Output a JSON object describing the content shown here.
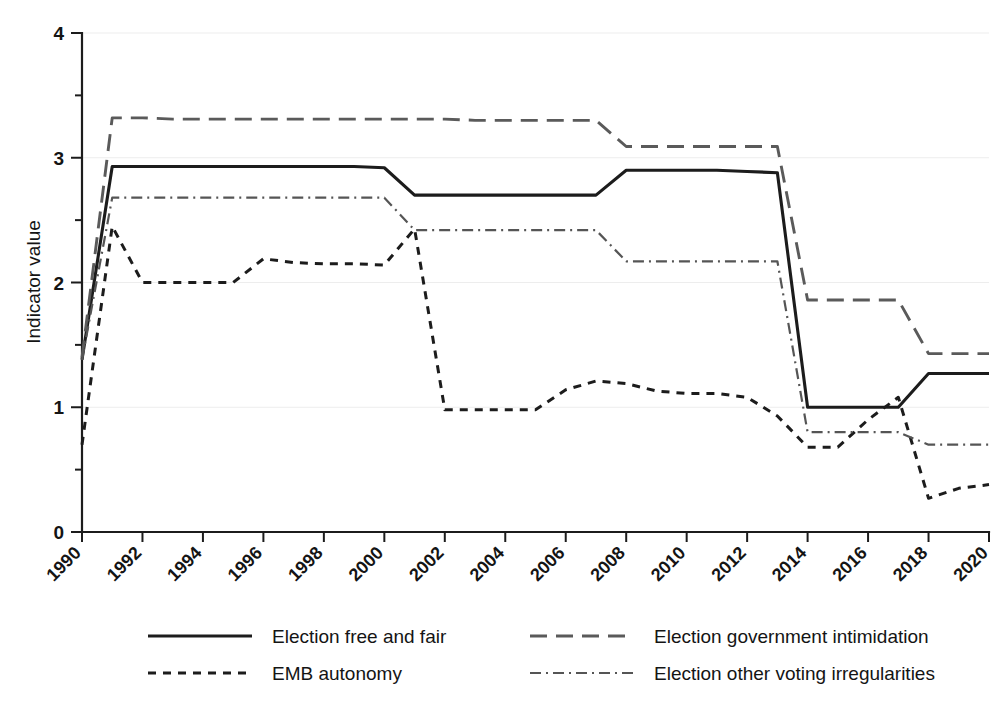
{
  "chart_data": {
    "type": "line",
    "title": "",
    "subtitle": "",
    "xlabel": "",
    "ylabel": "Indicator value",
    "xlim": [
      1990,
      2020
    ],
    "ylim": [
      0,
      4
    ],
    "grid": true,
    "legend_position": "bottom",
    "x_ticks": [
      "1990",
      "1992",
      "1994",
      "1996",
      "1998",
      "2000",
      "2002",
      "2004",
      "2006",
      "2008",
      "2010",
      "2012",
      "2014",
      "2016",
      "2018",
      "2020"
    ],
    "y_ticks": [
      "0",
      "1",
      "2",
      "3",
      "4"
    ],
    "x": [
      1990,
      1991,
      1992,
      1993,
      1994,
      1995,
      1996,
      1997,
      1998,
      1999,
      2000,
      2001,
      2002,
      2003,
      2004,
      2005,
      2006,
      2007,
      2008,
      2009,
      2010,
      2011,
      2012,
      2013,
      2014,
      2015,
      2016,
      2017,
      2018,
      2019,
      2020
    ],
    "series": [
      {
        "name": "Election free and fair",
        "style": "solid",
        "color": "#1c1c1c",
        "values": [
          1.38,
          2.93,
          2.93,
          2.93,
          2.93,
          2.93,
          2.93,
          2.93,
          2.93,
          2.93,
          2.92,
          2.7,
          2.7,
          2.7,
          2.7,
          2.7,
          2.7,
          2.7,
          2.9,
          2.9,
          2.9,
          2.9,
          2.89,
          2.88,
          1.0,
          1.0,
          1.0,
          1.0,
          1.27,
          1.27,
          1.27
        ]
      },
      {
        "name": "Election government intimidation",
        "style": "long-dash",
        "color": "#5a5a5a",
        "values": [
          1.4,
          3.32,
          3.32,
          3.31,
          3.31,
          3.31,
          3.31,
          3.31,
          3.31,
          3.31,
          3.31,
          3.31,
          3.31,
          3.3,
          3.3,
          3.3,
          3.3,
          3.3,
          3.09,
          3.09,
          3.09,
          3.09,
          3.09,
          3.09,
          1.86,
          1.86,
          1.86,
          1.86,
          1.43,
          1.43,
          1.43
        ]
      },
      {
        "name": "EMB autonomy",
        "style": "short-dash",
        "color": "#1c1c1c",
        "values": [
          0.7,
          2.45,
          2.0,
          2.0,
          2.0,
          2.0,
          2.19,
          2.16,
          2.15,
          2.15,
          2.14,
          2.43,
          0.98,
          0.98,
          0.98,
          0.98,
          1.14,
          1.21,
          1.19,
          1.13,
          1.11,
          1.11,
          1.08,
          0.93,
          0.68,
          0.68,
          0.9,
          1.08,
          0.27,
          0.35,
          0.38
        ]
      },
      {
        "name": "Election other voting irregularities",
        "style": "dash-dot",
        "color": "#555555",
        "values": [
          1.38,
          2.68,
          2.68,
          2.68,
          2.68,
          2.68,
          2.68,
          2.68,
          2.68,
          2.68,
          2.68,
          2.42,
          2.42,
          2.42,
          2.42,
          2.42,
          2.42,
          2.42,
          2.17,
          2.17,
          2.17,
          2.17,
          2.17,
          2.17,
          0.8,
          0.8,
          0.8,
          0.8,
          0.7,
          0.7,
          0.7
        ]
      }
    ]
  },
  "legend": {
    "items": [
      {
        "label": "Election free and fair"
      },
      {
        "label": "Election government intimidation"
      },
      {
        "label": "EMB autonomy"
      },
      {
        "label": "Election other voting irregularities"
      }
    ]
  }
}
